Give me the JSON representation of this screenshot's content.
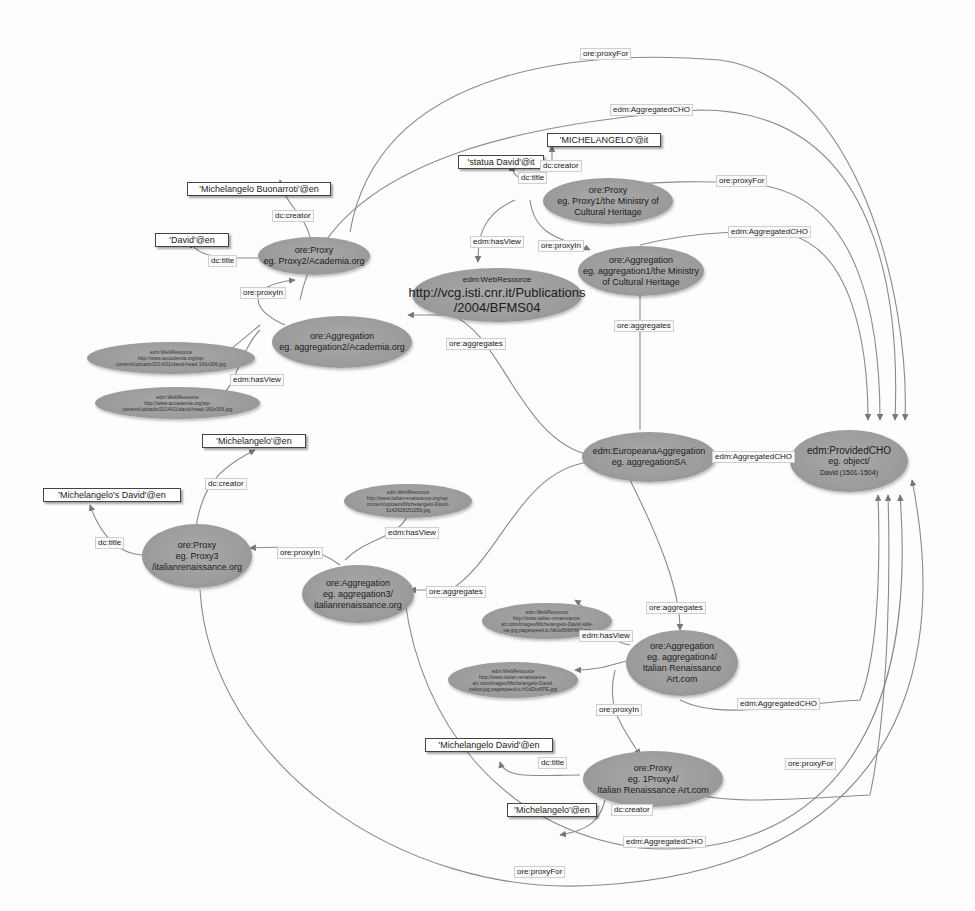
{
  "diagram": {
    "nodes": {
      "provided_cho": {
        "line1": "edm:ProvidedCHO",
        "line2": "eg. object/",
        "line3": "David (1501-1504)"
      },
      "europeana_aggregation": {
        "line1": "edm:EuropeanaAggregation",
        "line2": "eg. aggregationSA"
      },
      "proxy1": {
        "line1": "ore:Proxy",
        "line2": "eg. Proxy1/the Ministry of",
        "line3": "Cultural Heritage"
      },
      "aggregation1": {
        "line1": "ore:Aggregation",
        "line2": "eg. aggregation1/the Ministry",
        "line3": "of Cultural Heritage"
      },
      "webresource1": {
        "line1": "edm:WebResource",
        "line2": "http://vcg.isti.cnr.it/Publications",
        "line3": "/2004/BFMS04"
      },
      "proxy2": {
        "line1": "ore:Proxy",
        "line2": "eg. Proxy2/Academia.org"
      },
      "aggregation2": {
        "line1": "ore:Aggregation",
        "line2": "eg. aggregation2/Academia.org"
      },
      "webresource2a": {
        "line1": "edm:WebResource",
        "line2": "http://www.accademia.org/wp-",
        "line3": "content/uploads/2014/01/david-head-160x306.jpg"
      },
      "webresource2b": {
        "line1": "edm:WebResource",
        "line2": "http://www.accademia.org/wp-",
        "line3": "content/uploads/2014/01/david-head-160x306.jpg"
      },
      "proxy3": {
        "line1": "ore:Proxy",
        "line2": "eg. Proxy3",
        "line3": "/italianrenaissance.org"
      },
      "aggregation3": {
        "line1": "ore:Aggregation",
        "line2": "eg. aggregation3/",
        "line3": "italianrenaissance.org"
      },
      "webresource3": {
        "line1": "edm:WebResource",
        "line2": "http://www.italianrenaissance.org/wp-",
        "line3": "content/uploads/Michelangelo-David-",
        "line4": "6142628151059.jpg"
      },
      "aggregation4": {
        "line1": "ore:Aggregation",
        "line2": "eg. aggregation4/",
        "line3": "Italian Renaissance",
        "line4": "Art.com"
      },
      "proxy4": {
        "line1": "ore:Proxy",
        "line2": "eg. 1Proxy4/",
        "line3": "Italian Renaissance Art.com"
      },
      "webresource4a": {
        "line1": "edm:WebResource",
        "line2": "http://www.italian-renaissance-",
        "line3": "art.com/images/Michelangelo-David-side-",
        "line4": "vie.jpg pagespeed.ic.Nk0e5bWHAC.jpg"
      },
      "webresource4b": {
        "line1": "edm:WebResource",
        "line2": "http://www.italian-renaissance-",
        "line3": "art.com/images/Michelangelo-David-",
        "line4": "below.jpg.pagespeed.ic.H0dDtxKPE.jpg"
      }
    },
    "literals": {
      "michelangelo_it": "'MICHELANGELO'@it",
      "statua_david_it": "'statua David'@it",
      "buonarroti_en": "'Michelangelo Buonarroti'@en",
      "david_en": "'David'@en",
      "michelangelo_en_1": "'Michelangelo'@en",
      "michelangelos_david_en": "'Michelangelo's David'@en",
      "michelangelo_david_en": "'Michelangelo David'@en",
      "michelangelo_en_2": "'Michelangelo'@en"
    },
    "edge_labels": {
      "proxyfor_top": "ore:proxyFor",
      "aggcho_top": "edm:AggregatedCHO",
      "dc_creator_p1": "dc:creator",
      "dc_title_p1": "dc:title",
      "proxyfor_p1": "ore:proxyFor",
      "hasview_p1": "edm:hasView",
      "proxyin_p1": "ore:proxyIn",
      "aggcho_a1": "edm:AggregatedCHO",
      "aggregates_a1": "ore:aggregates",
      "dc_creator_p2": "dc:creator",
      "dc_title_p2": "dc:title",
      "proxyin_p2": "ore:proxyIn",
      "aggregates_a2": "ore:aggregates",
      "hasview_a2": "edm:hasView",
      "aggcho_ea": "edm:AggregatedCHO",
      "dc_creator_p3": "dc:creator",
      "dc_title_p3": "dc:title",
      "proxyin_p3": "ore:proxyIn",
      "hasview_a3": "edm:hasView",
      "aggregates_a3": "ore:aggregates",
      "aggregates_a4": "ore:aggregates",
      "hasview_a4": "edm:hasView",
      "aggcho_a4": "edm:AggregatedCHO",
      "proxyin_p4": "ore:proxyIn",
      "dc_title_p4": "dc:title",
      "proxyfor_p4": "ore:proxyFor",
      "dc_creator_p4": "dc:creator",
      "aggcho_bottom": "edm:AggregatedCHO",
      "proxyfor_bottom": "ore:proxyFor"
    },
    "colors": {
      "node_fill": "#9e9e9e",
      "edge": "#8a8a8a",
      "background": "#fdfdfd"
    }
  }
}
